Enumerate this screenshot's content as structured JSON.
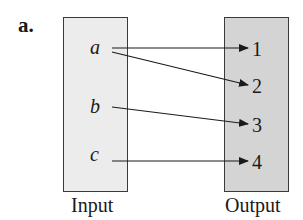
{
  "diagram": {
    "label": "a.",
    "input": {
      "caption": "Input",
      "items": [
        "a",
        "b",
        "c"
      ]
    },
    "output": {
      "caption": "Output",
      "items": [
        "1",
        "2",
        "3",
        "4"
      ]
    },
    "mappings": [
      {
        "from": "a",
        "to": "1"
      },
      {
        "from": "a",
        "to": "2"
      },
      {
        "from": "b",
        "to": "3"
      },
      {
        "from": "c",
        "to": "4"
      }
    ],
    "colors": {
      "input_fill": "#ececec",
      "output_fill": "#d4d4d4",
      "stroke": "#1a1a1a"
    }
  }
}
